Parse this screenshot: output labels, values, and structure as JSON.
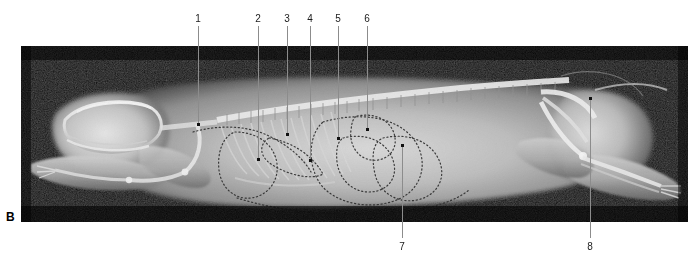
{
  "figure": {
    "panel_letter": "B",
    "modality": "radiograph",
    "view": "lateral",
    "background_color": "#ffffff",
    "image_background_color": "#050505",
    "leader_line_color": "#8c8c8c",
    "label_color": "#1a1a1a"
  },
  "image_frame": {
    "x": 21,
    "y": 46,
    "width": 667,
    "height": 176
  },
  "labels_top": [
    {
      "id": "1",
      "text": "1",
      "x": 198,
      "y": 16,
      "line_x": 198,
      "line_top": 26,
      "line_bottom": 125
    },
    {
      "id": "2",
      "text": "2",
      "x": 258,
      "y": 16,
      "line_x": 258,
      "line_top": 26,
      "line_bottom": 160
    },
    {
      "id": "3",
      "text": "3",
      "x": 287,
      "y": 16,
      "line_x": 287,
      "line_top": 26,
      "line_bottom": 135
    },
    {
      "id": "4",
      "text": "4",
      "x": 310,
      "y": 16,
      "line_x": 310,
      "line_top": 26,
      "line_bottom": 161
    },
    {
      "id": "5",
      "text": "5",
      "x": 338,
      "y": 16,
      "line_x": 338,
      "line_top": 26,
      "line_bottom": 139
    },
    {
      "id": "6",
      "text": "6",
      "x": 367,
      "y": 16,
      "line_x": 367,
      "line_top": 26,
      "line_bottom": 130
    }
  ],
  "labels_bottom": [
    {
      "id": "7",
      "text": "7",
      "x": 402,
      "y": 243,
      "line_x": 402,
      "line_top": 146,
      "line_bottom": 238
    },
    {
      "id": "8",
      "text": "8",
      "x": 590,
      "y": 243,
      "line_x": 590,
      "line_top": 99,
      "line_bottom": 238
    }
  ]
}
